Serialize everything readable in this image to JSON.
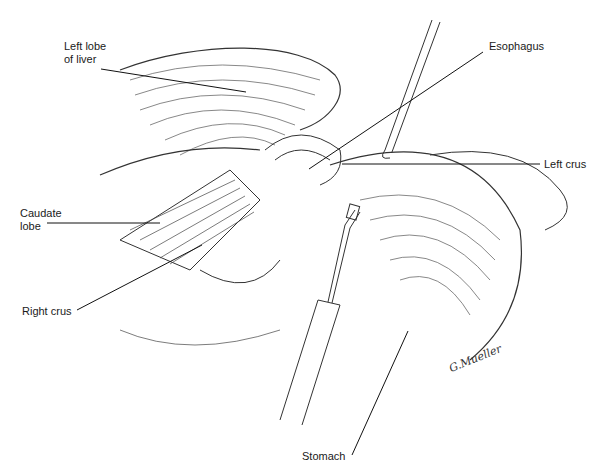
{
  "figure": {
    "labels": [
      {
        "id": "left-lobe-of-liver",
        "text": "Left lobe\nof liver",
        "x": 64,
        "y": 53
      },
      {
        "id": "esophagus",
        "text": "Esophagus",
        "x": 489,
        "y": 45
      },
      {
        "id": "left-crus",
        "text": "Left crus",
        "x": 544,
        "y": 159
      },
      {
        "id": "caudate-lobe",
        "text": "Caudate\nlobe",
        "x": 20,
        "y": 207
      },
      {
        "id": "right-crus",
        "text": "Right crus",
        "x": 22,
        "y": 303
      },
      {
        "id": "stomach",
        "text": "Stomach",
        "x": 302,
        "y": 451
      }
    ],
    "leader_lines": [
      {
        "label": "left-lobe-of-liver",
        "x1": 101,
        "y1": 69,
        "x2": 246,
        "y2": 92
      },
      {
        "label": "esophagus",
        "x1": 483,
        "y1": 52,
        "x2": 309,
        "y2": 169
      },
      {
        "label": "left-crus",
        "x1": 540,
        "y1": 164,
        "x2": 342,
        "y2": 164
      },
      {
        "label": "caudate-lobe",
        "x1": 47,
        "y1": 223,
        "x2": 160,
        "y2": 223
      },
      {
        "label": "right-crus",
        "x1": 77,
        "y1": 310,
        "x2": 202,
        "y2": 245
      },
      {
        "label": "stomach",
        "x1": 352,
        "y1": 455,
        "x2": 408,
        "y2": 331
      }
    ],
    "signature": "G.Mueller"
  }
}
